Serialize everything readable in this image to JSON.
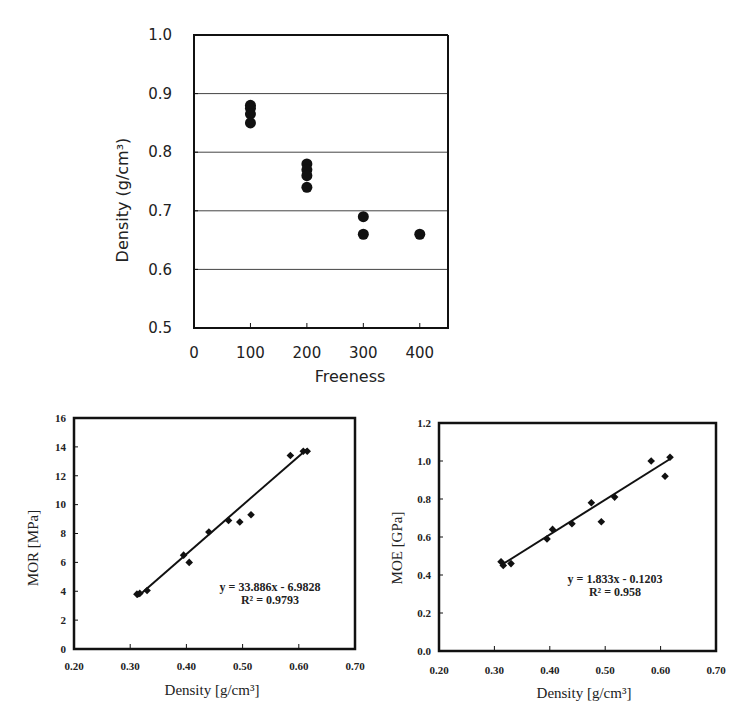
{
  "chart_data": [
    {
      "id": "density-vs-freeness",
      "type": "scatter",
      "title": "",
      "xlabel": "Freeness",
      "ylabel": "Density  (g/cm³)",
      "xlim": [
        0,
        450
      ],
      "ylim": [
        0.5,
        1.0
      ],
      "xticks": [
        0,
        100,
        200,
        300,
        400
      ],
      "yticks": [
        0.5,
        0.6,
        0.7,
        0.8,
        0.9,
        1.0
      ],
      "ytick_labels": [
        "0.5",
        "0.6",
        "0.7",
        "0.8",
        "0.9",
        "1.0"
      ],
      "grid": "horizontal",
      "marker": "circle",
      "series": [
        {
          "name": "Density",
          "x": [
            100,
            100,
            100,
            100,
            200,
            200,
            200,
            200,
            300,
            300,
            400
          ],
          "y": [
            0.88,
            0.875,
            0.865,
            0.85,
            0.78,
            0.77,
            0.76,
            0.74,
            0.69,
            0.66,
            0.66
          ]
        }
      ]
    },
    {
      "id": "mor-vs-density",
      "type": "scatter",
      "xlabel": "Density [g/cm³]",
      "ylabel": "MOR [MPa]",
      "xlim": [
        0.2,
        0.7
      ],
      "ylim": [
        0,
        16
      ],
      "xticks": [
        0.2,
        0.3,
        0.4,
        0.5,
        0.6,
        0.7
      ],
      "xtick_labels": [
        "0.20",
        "0.30",
        "0.40",
        "0.50",
        "0.60",
        "0.70"
      ],
      "yticks": [
        0,
        2,
        4,
        6,
        8,
        10,
        12,
        14,
        16
      ],
      "grid": "none",
      "marker": "diamond",
      "series": [
        {
          "name": "MOR",
          "x": [
            0.312,
            0.317,
            0.33,
            0.395,
            0.405,
            0.44,
            0.475,
            0.495,
            0.515,
            0.585,
            0.608,
            0.615
          ],
          "y": [
            3.8,
            3.85,
            4.05,
            6.5,
            6.0,
            8.1,
            8.9,
            8.8,
            9.3,
            13.4,
            13.7,
            13.7
          ]
        }
      ],
      "trendline": {
        "type": "linear",
        "slope": 33.886,
        "intercept": -6.9828,
        "x_range": [
          0.312,
          0.615
        ],
        "equation": "y = 33.886x - 6.9828",
        "r2": "R² = 0.9793"
      }
    },
    {
      "id": "moe-vs-density",
      "type": "scatter",
      "xlabel": "Density [g/cm³]",
      "ylabel": "MOE [GPa]",
      "xlim": [
        0.2,
        0.7
      ],
      "ylim": [
        0.0,
        1.2
      ],
      "xticks": [
        0.2,
        0.3,
        0.4,
        0.5,
        0.6,
        0.7
      ],
      "xtick_labels": [
        "0.20",
        "0.30",
        "0.40",
        "0.50",
        "0.60",
        "0.70"
      ],
      "yticks": [
        0.0,
        0.2,
        0.4,
        0.6,
        0.8,
        1.0,
        1.2
      ],
      "ytick_labels": [
        "0.0",
        "0.2",
        "0.4",
        "0.6",
        "0.8",
        "1.0",
        "1.2"
      ],
      "grid": "none",
      "marker": "diamond",
      "series": [
        {
          "name": "MOE",
          "x": [
            0.312,
            0.316,
            0.33,
            0.395,
            0.405,
            0.44,
            0.475,
            0.493,
            0.517,
            0.583,
            0.608,
            0.617
          ],
          "y": [
            0.47,
            0.45,
            0.46,
            0.59,
            0.64,
            0.67,
            0.78,
            0.68,
            0.81,
            1.0,
            0.92,
            1.02
          ]
        }
      ],
      "trendline": {
        "type": "linear",
        "slope": 1.833,
        "intercept": -0.1203,
        "x_range": [
          0.312,
          0.617
        ],
        "equation": "y = 1.833x - 0.1203",
        "r2": "R² = 0.958"
      }
    }
  ],
  "colors": {
    "ink": "#111111",
    "grid": "#444444",
    "background": "#ffffff"
  }
}
